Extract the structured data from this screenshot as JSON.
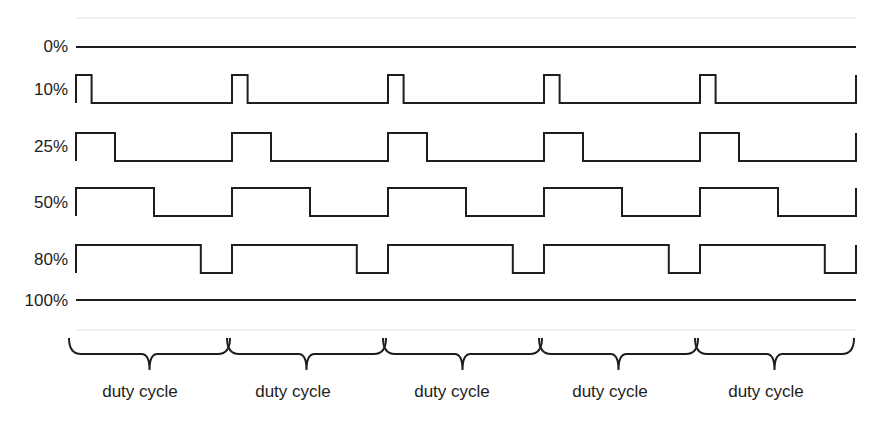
{
  "diagram": {
    "periods": 5,
    "rows": [
      {
        "label": "0%",
        "duty": 0
      },
      {
        "label": "10%",
        "duty": 0.1
      },
      {
        "label": "25%",
        "duty": 0.25
      },
      {
        "label": "50%",
        "duty": 0.5
      },
      {
        "label": "80%",
        "duty": 0.8
      },
      {
        "label": "100%",
        "duty": 1.0
      }
    ],
    "brace_labels": [
      "duty cycle",
      "duty cycle",
      "duty cycle",
      "duty cycle",
      "duty cycle"
    ],
    "line_color": "#1e1e1e"
  }
}
